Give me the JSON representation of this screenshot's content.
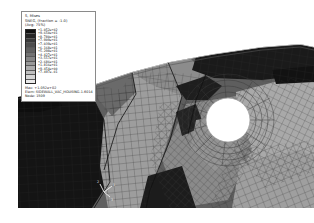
{
  "window": {
    "title": "Abaqus Viewport - Contour Plot",
    "background_color": "#ffffff"
  },
  "legend": {
    "variable_line": "S, Mises",
    "section_line": "(Avg: 75%)",
    "coordinate_line": "SNEG, (fraction = -1.0)",
    "levels": [
      "+1.052e+02",
      "+9.650e+01",
      "+8.780e+01",
      "+7.909e+01",
      "+7.039e+01",
      "+6.168e+01",
      "+5.298e+01",
      "+4.427e+01",
      "+3.557e+01",
      "+2.686e+01",
      "+1.816e+01",
      "+9.454e+00",
      "+7.497e-01"
    ],
    "band_colors": [
      "#111111",
      "#262626",
      "#3a3a3a",
      "#4e4e4e",
      "#606060",
      "#727272",
      "#858585",
      "#989898",
      "#ababab",
      "#bfbfbf",
      "#d4d4d4",
      "#eaeaea"
    ],
    "footer": [
      "Max: +1.052e+02",
      "Elem: SIDEWALL_VAC_HOUSING-1.6014",
      "Node: 1509"
    ],
    "border_color": "#8a8a8a"
  },
  "model": {
    "description": "Deformed finite element shell mesh with circular cut-out, grayscale von Mises stress contours",
    "hole": {
      "cx": 228,
      "cy": 120,
      "r": 22,
      "fill": "#ffffff"
    },
    "mesh_line_color": "#2b2b2b",
    "regions": [
      {
        "name": "left-dark-panel",
        "shade": "#141414"
      },
      {
        "name": "mid-light-band",
        "shade": "#9a9a9a"
      },
      {
        "name": "upper-mid-grey",
        "shade": "#6e6e6e"
      },
      {
        "name": "right-upper-dark",
        "shade": "#171717"
      },
      {
        "name": "right-light-panel",
        "shade": "#a8a8a8"
      },
      {
        "name": "lower-right-mid",
        "shade": "#878787"
      },
      {
        "name": "bottom-dark-wedge",
        "shade": "#1a1a1a"
      }
    ]
  },
  "triad": {
    "label_1": "1",
    "label_2": "2",
    "label_3": "3",
    "color": "#f2f2f2"
  }
}
